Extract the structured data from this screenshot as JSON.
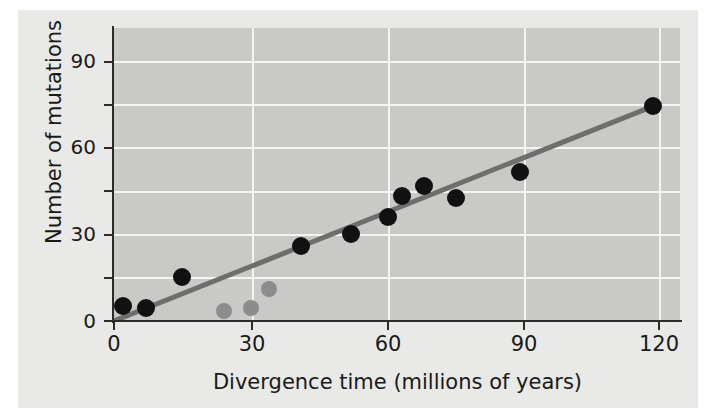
{
  "chart_data": {
    "type": "scatter",
    "title": "",
    "xlabel": "Divergence time (millions of years)",
    "ylabel": "Number of mutations",
    "xlim": [
      0,
      124
    ],
    "ylim": [
      0,
      101
    ],
    "xticks": [
      0,
      30,
      60,
      90,
      120
    ],
    "xtick_labels": [
      "0",
      "30",
      "60",
      "90",
      "120"
    ],
    "yticks": [
      0,
      30,
      60,
      90
    ],
    "ytick_labels": [
      "0",
      "30",
      "60",
      "90"
    ],
    "y_minor_ticks": [
      15,
      45,
      75
    ],
    "grid": true,
    "grid_color": "#f4f4f2",
    "plot_background": "#c9c9c7",
    "legend": null,
    "series": [
      {
        "name": "primary",
        "marker": "filled-circle",
        "color": "#111111",
        "radius": 9,
        "points": [
          {
            "x": 2,
            "y": 5
          },
          {
            "x": 7,
            "y": 4.5
          },
          {
            "x": 15,
            "y": 15
          },
          {
            "x": 41,
            "y": 26
          },
          {
            "x": 52,
            "y": 30
          },
          {
            "x": 60,
            "y": 36
          },
          {
            "x": 63,
            "y": 43
          },
          {
            "x": 68,
            "y": 46.5
          },
          {
            "x": 75,
            "y": 42.5
          },
          {
            "x": 89,
            "y": 51.5
          },
          {
            "x": 118,
            "y": 74
          }
        ]
      },
      {
        "name": "secondary",
        "marker": "filled-circle",
        "color": "#8c8c8c",
        "radius": 8,
        "points": [
          {
            "x": 24,
            "y": 3.5
          },
          {
            "x": 30,
            "y": 4.5
          },
          {
            "x": 34,
            "y": 11
          }
        ]
      }
    ],
    "trendline": {
      "color": "#6e6e6e",
      "width": 5,
      "x_start": 0,
      "y_start": 0,
      "x_end": 118,
      "y_end": 74
    }
  }
}
